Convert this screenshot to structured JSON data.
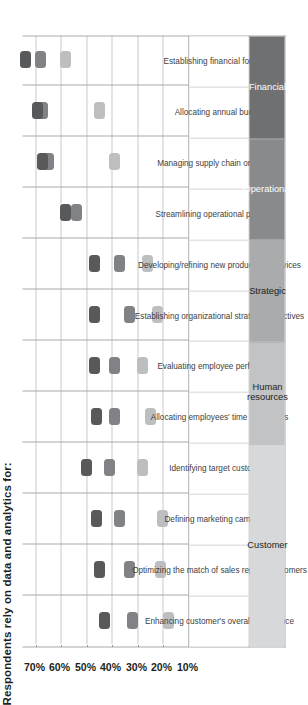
{
  "chart_data": {
    "type": "scatter",
    "title": "Respondents rely on data and analytics for:",
    "xlabel": "",
    "ylabel": "",
    "ylim": [
      10,
      75
    ],
    "grid": true,
    "legend_position": "bottom-right",
    "axis_ticks": [
      "10%",
      "20%",
      "30%",
      "40%",
      "50%",
      "60%",
      "70%"
    ],
    "axis_tick_values": [
      10,
      20,
      30,
      40,
      50,
      60,
      70
    ],
    "categories": [
      "Enhancing customer's overall experience",
      "Optimizing the match of sales reps to customers",
      "Defining marketing campaigns",
      "Identifying target customers",
      "Allocating employees' time and efforts",
      "Evaluating employee performance",
      "Establishing organizational strategic objectives",
      "Developing/refining new products or services",
      "Streamlining operational processes",
      "Managing supply chain or logistics",
      "Allocating annual budget",
      "Establishing financial forecasts"
    ],
    "series": [
      {
        "name": "Aspirational",
        "color": "#bcbec0",
        "values": [
          18,
          21,
          20,
          28,
          25,
          28,
          22,
          26,
          null,
          39,
          45,
          58
        ]
      },
      {
        "name": "Experienced",
        "color": "#808285",
        "values": [
          32,
          33,
          37,
          41,
          39,
          39,
          33,
          37,
          54,
          65,
          67,
          68
        ]
      },
      {
        "name": "Transformed",
        "color": "#58595b",
        "values": [
          43,
          45,
          46,
          50,
          46,
          47,
          47,
          47,
          58,
          67,
          69,
          74
        ]
      }
    ],
    "groups": [
      {
        "label": "Customer",
        "span": 4,
        "color": "#d7d8d9",
        "dark": false
      },
      {
        "label": "Human resources",
        "span": 2,
        "color": "#c2c3c5",
        "dark": false
      },
      {
        "label": "Strategic",
        "span": 2,
        "color": "#a9abad",
        "dark": false
      },
      {
        "label": "Operational",
        "span": 2,
        "color": "#888a8c",
        "dark": true
      },
      {
        "label": "Financial",
        "span": 2,
        "color": "#6e7072",
        "dark": true
      }
    ]
  }
}
